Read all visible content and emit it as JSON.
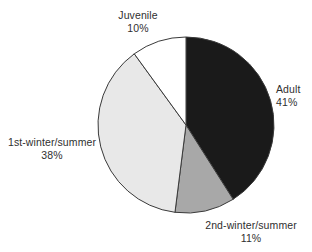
{
  "chart_data": {
    "type": "pie",
    "title": "",
    "subtitle": "",
    "xlabel": "",
    "ylabel": "",
    "legend_position": "none",
    "grid": false,
    "units": "percent",
    "start_angle_deg": 0,
    "direction": "clockwise",
    "total": 100,
    "categories": [
      "Adult",
      "2nd-winter/summer",
      "1st-winter/summer",
      "Juvenile"
    ],
    "values": [
      41,
      11,
      38,
      10
    ],
    "labels_formatted": [
      "41%",
      "11%",
      "38%",
      "10%"
    ],
    "colors": [
      "#1a1a1a",
      "#a8a8a8",
      "#e8e8e8",
      "#ffffff"
    ],
    "slices": [
      {
        "name": "Adult",
        "value": 41,
        "value_label": "41%",
        "color": "#1a1a1a",
        "start_deg": 0,
        "end_deg": 147.6
      },
      {
        "name": "2nd-winter/summer",
        "value": 11,
        "value_label": "11%",
        "color": "#a8a8a8",
        "start_deg": 147.6,
        "end_deg": 187.2
      },
      {
        "name": "1st-winter/summer",
        "value": 38,
        "value_label": "38%",
        "color": "#e8e8e8",
        "start_deg": 187.2,
        "end_deg": 324.0
      },
      {
        "name": "Juvenile",
        "value": 10,
        "value_label": "10%",
        "color": "#ffffff",
        "start_deg": 324.0,
        "end_deg": 360.0
      }
    ],
    "geometry": {
      "center_x": 186,
      "center_y": 125,
      "radius": 88
    },
    "style": {
      "outline_color": "#3a3a3a",
      "text_color": "#2f2f2f",
      "background": "#ffffff"
    }
  }
}
